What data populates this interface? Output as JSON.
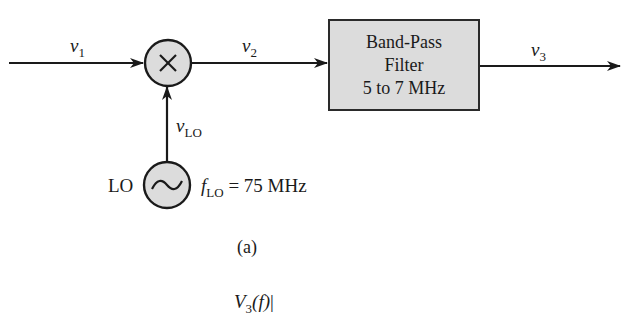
{
  "diagram": {
    "figure_label": "(a)",
    "signals": {
      "v1": {
        "base": "v",
        "sub": "1"
      },
      "v2": {
        "base": "v",
        "sub": "2"
      },
      "v3": {
        "base": "v",
        "sub": "3"
      },
      "vlo": {
        "base": "v",
        "sub": "LO"
      }
    },
    "mixer": {
      "symbol": "×"
    },
    "filter": {
      "lines": [
        "Band-Pass",
        "Filter",
        "5 to 7 MHz"
      ]
    },
    "oscillator": {
      "label": "LO",
      "symbol": "~",
      "freq_base": "f",
      "freq_sub": "LO",
      "freq_value": " = 75 MHz"
    },
    "next_figure_partial": {
      "text": "V",
      "sub": "3",
      "arg": "(f)",
      "bar": "|"
    },
    "colors": {
      "stroke": "#1a1a1a",
      "fill": "#dcdcdc",
      "background": "#ffffff"
    }
  }
}
